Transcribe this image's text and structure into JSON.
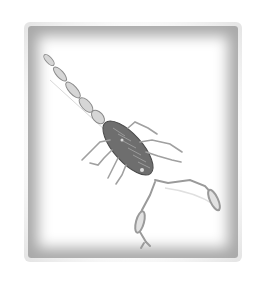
{
  "image": {
    "subject": "scorpion illustration",
    "frame": "vignette border",
    "colors": {
      "background": "#ffffff",
      "frame": "#a9a9a9",
      "body": "#5a5a5a",
      "limbs": "#9a9a9a"
    }
  }
}
